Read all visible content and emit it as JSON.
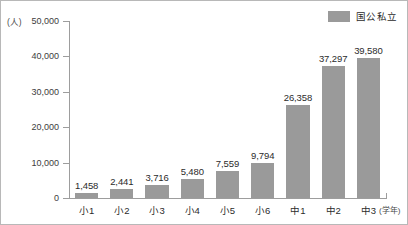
{
  "chart_data": {
    "type": "bar",
    "title": "",
    "xlabel": "(学年)",
    "ylabel": "(人)",
    "categories": [
      "小1",
      "小2",
      "小3",
      "小4",
      "小5",
      "小6",
      "中1",
      "中2",
      "中3"
    ],
    "values": [
      1458,
      2441,
      3716,
      5480,
      7559,
      9794,
      26358,
      37297,
      39580
    ],
    "value_labels": [
      "1,458",
      "2,441",
      "3,716",
      "5,480",
      "7,559",
      "9,794",
      "26,358",
      "37,297",
      "39,580"
    ],
    "series": [
      {
        "name": "国公私立",
        "values": [
          1458,
          2441,
          3716,
          5480,
          7559,
          9794,
          26358,
          37297,
          39580
        ],
        "color": "#9a9a9a"
      }
    ],
    "ylim": [
      0,
      50000
    ],
    "ytick_values": [
      0,
      10000,
      20000,
      30000,
      40000,
      50000
    ],
    "ytick_labels": [
      "0",
      "10,000",
      "20,000",
      "30,000",
      "40,000",
      "50,000"
    ],
    "grid": false,
    "legend_position": "top-right"
  },
  "legend": {
    "entries": [
      {
        "label": "国公私立",
        "color": "#9a9a9a"
      }
    ]
  },
  "axes": {
    "y_unit": "(人)",
    "x_unit": "(学年)"
  },
  "colors": {
    "bar": "#9a9a9a",
    "axis": "#9d9d9d",
    "border": "#b8b8b8",
    "text": "#2b2b2b"
  }
}
